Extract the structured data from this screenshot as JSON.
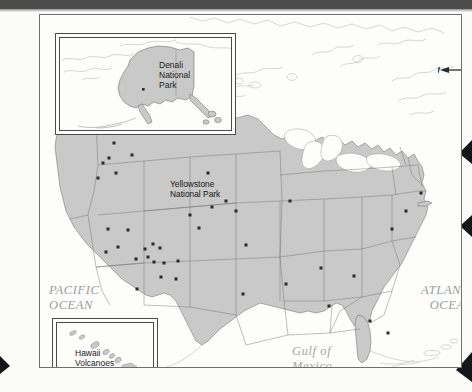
{
  "map": {
    "title": "United States National Parks Map",
    "land_fill": "#c9c9c9",
    "land_stroke": "#6a6a6a",
    "water_fill": "#fdfdfc",
    "outline_stroke": "#b9b9b9",
    "marker_color": "#2a2a2a"
  },
  "compass": {
    "north": "N",
    "south": "S",
    "east": "E",
    "west": "W"
  },
  "water_labels": {
    "pacific": "PACIFIC\nOCEAN",
    "atlantic": "ATLANTIC\nOCEAN",
    "gulf": "Gulf of\nMexico"
  },
  "park_labels": {
    "yellowstone": "Yellowstone\nNational Park",
    "denali": "Denali\nNational\nPark",
    "hawaii_volcanoes": "Hawaii\nVolcanoes\nNational Park"
  },
  "insets": [
    {
      "name": "alaska",
      "label": "Denali\nNational\nPark"
    },
    {
      "name": "hawaii",
      "label": "Hawaii\nVolcanoes\nNational Park"
    }
  ],
  "park_markers": [
    {
      "x": 74,
      "y": 128
    },
    {
      "x": 63,
      "y": 148
    },
    {
      "x": 69,
      "y": 143
    },
    {
      "x": 58,
      "y": 163
    },
    {
      "x": 76,
      "y": 158
    },
    {
      "x": 92,
      "y": 140
    },
    {
      "x": 68,
      "y": 214
    },
    {
      "x": 88,
      "y": 215
    },
    {
      "x": 78,
      "y": 232
    },
    {
      "x": 66,
      "y": 237
    },
    {
      "x": 105,
      "y": 234
    },
    {
      "x": 113,
      "y": 229
    },
    {
      "x": 120,
      "y": 233
    },
    {
      "x": 108,
      "y": 242
    },
    {
      "x": 114,
      "y": 247
    },
    {
      "x": 96,
      "y": 244
    },
    {
      "x": 124,
      "y": 248
    },
    {
      "x": 138,
      "y": 246
    },
    {
      "x": 121,
      "y": 262
    },
    {
      "x": 136,
      "y": 264
    },
    {
      "x": 97,
      "y": 274
    },
    {
      "x": 150,
      "y": 200
    },
    {
      "x": 168,
      "y": 158
    },
    {
      "x": 186,
      "y": 186
    },
    {
      "x": 172,
      "y": 192
    },
    {
      "x": 196,
      "y": 196
    },
    {
      "x": 159,
      "y": 213
    },
    {
      "x": 206,
      "y": 230
    },
    {
      "x": 203,
      "y": 279
    },
    {
      "x": 246,
      "y": 269
    },
    {
      "x": 250,
      "y": 186
    },
    {
      "x": 281,
      "y": 253
    },
    {
      "x": 314,
      "y": 261
    },
    {
      "x": 289,
      "y": 291
    },
    {
      "x": 330,
      "y": 306
    },
    {
      "x": 348,
      "y": 318
    },
    {
      "x": 352,
      "y": 214
    },
    {
      "x": 366,
      "y": 196
    },
    {
      "x": 381,
      "y": 178
    }
  ]
}
